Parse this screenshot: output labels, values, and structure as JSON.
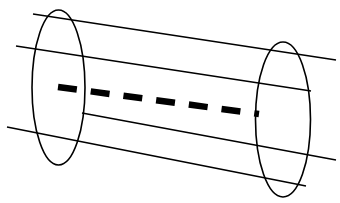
{
  "canvas": {
    "width": 340,
    "height": 203,
    "background_color": "#ffffff"
  },
  "figure": {
    "stroke_color": "#000000",
    "thin_stroke_width": 1.6,
    "axis_stroke_color": "#000000",
    "axis_stroke_width": 6.5
  },
  "chart_data": {
    "type": "diagram",
    "elements": [
      {
        "name": "left-end-cap-ellipse",
        "shape": "ellipse",
        "cx": 58.5,
        "cy": 87.5,
        "rx": 26.5,
        "ry": 77.5,
        "rotation_deg": 0,
        "fill": "none",
        "stroke": "#000000",
        "stroke_width": 1.6
      },
      {
        "name": "right-end-cap-ellipse",
        "shape": "ellipse",
        "cx": 283.0,
        "cy": 119.5,
        "rx": 27.5,
        "ry": 77.5,
        "rotation_deg": 0,
        "fill": "none",
        "stroke": "#000000",
        "stroke_width": 1.6
      },
      {
        "name": "wall-line-top",
        "shape": "line",
        "x1": 33,
        "y1": 14,
        "x2": 336,
        "y2": 60,
        "stroke": "#000000",
        "stroke_width": 1.6
      },
      {
        "name": "wall-line-upper-middle",
        "shape": "line",
        "x1": 16,
        "y1": 46,
        "x2": 311,
        "y2": 91,
        "stroke": "#000000",
        "stroke_width": 1.6
      },
      {
        "name": "wall-line-lower-middle",
        "shape": "line",
        "x1": 82,
        "y1": 113,
        "x2": 336,
        "y2": 160,
        "stroke": "#000000",
        "stroke_width": 1.6
      },
      {
        "name": "wall-line-bottom",
        "shape": "line",
        "x1": 7,
        "y1": 127,
        "x2": 306,
        "y2": 186,
        "stroke": "#000000",
        "stroke_width": 1.6
      },
      {
        "name": "central-axis-dashed-line",
        "shape": "dashed-line",
        "x1": 58,
        "y1": 87,
        "x2": 259,
        "y2": 114,
        "stroke": "#000000",
        "stroke_width": 6.5,
        "dash_count": 7,
        "dash_length": 19,
        "gap_length": 14
      }
    ],
    "counts": {
      "ellipses": 2,
      "straight_lines": 4,
      "dashes": 7
    }
  }
}
